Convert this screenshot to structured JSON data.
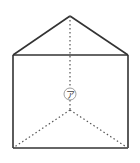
{
  "figure": {
    "type": "triangular-prism",
    "label": "ア",
    "colors": {
      "edge": "#333333",
      "hidden_edge": "#555555",
      "label_circle": "#888888",
      "label_text": "#444444",
      "background": "#ffffff"
    },
    "vertices": {
      "apex_top": [
        70,
        16
      ],
      "top_left": [
        13,
        55
      ],
      "top_right": [
        128,
        55
      ],
      "bottom_left": [
        13,
        148
      ],
      "bottom_right": [
        128,
        148
      ],
      "hidden_back": [
        70,
        110
      ]
    }
  }
}
